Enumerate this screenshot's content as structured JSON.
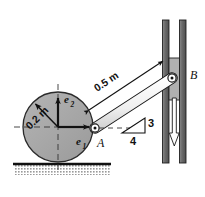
{
  "figure": {
    "colors": {
      "wheel_fill": "#a8a8a8",
      "wheel_stroke": "#2b2b2b",
      "bar_fill": "#f2f2f2",
      "bar_stroke": "#1a1a1a",
      "rail_fill": "#6e6e6e",
      "rail_stroke": "#1f1f1f",
      "slider_fill": "#b0b0b0",
      "slider_stroke": "#1f1f1f",
      "ground_line": "#111111",
      "ground_hatch": "#b5b5b5",
      "arrow_fill": "#ffffff",
      "label_color": "#111111",
      "dashed_color": "#333333"
    },
    "labels": {
      "radius": "0.2 m",
      "bar_length": "0.5 m",
      "unit_vector_1": "e",
      "unit_vector_1_sub": "1",
      "unit_vector_2": "e",
      "unit_vector_2_sub": "2",
      "point_a": "A",
      "point_b": "B",
      "slope_rise": "3",
      "slope_run": "4"
    },
    "geometry": {
      "wheel_center_x": 58,
      "wheel_center_y": 127,
      "wheel_radius": 35,
      "point_a_x": 95,
      "point_a_y": 128,
      "point_b_x": 172,
      "point_b_y": 78,
      "ground_y": 163,
      "rail_top_y": 20,
      "rail_bottom_y": 163
    }
  }
}
